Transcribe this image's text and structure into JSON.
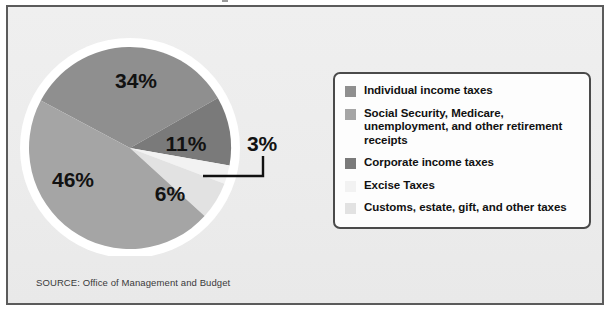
{
  "figure": {
    "source_note": "SOURCE: Office of Management and Budget",
    "background_color": "#ececec",
    "frame_color": "#5b5b5b"
  },
  "callout": {
    "label": "3%"
  },
  "legend": {
    "box_border_color": "#4a4a4a",
    "box_background": "#fdfdfd",
    "items": [
      {
        "label": "Individual income taxes",
        "color": "#8f8f8f"
      },
      {
        "label": "Social Security, Medicare, unemployment, and other retirement receipts",
        "color": "#a5a5a5"
      },
      {
        "label": "Corporate income taxes",
        "color": "#7a7a7a"
      },
      {
        "label": "Excise Taxes",
        "color": "#f2f2f2"
      },
      {
        "label": "Customs, estate, gift, and other taxes",
        "color": "#e2e2e2"
      }
    ]
  },
  "chart_data": {
    "type": "pie",
    "title": "",
    "subtitle": "",
    "xlabel": "",
    "ylabel": "",
    "legend_position": "right",
    "grid": false,
    "units": "percent",
    "categories": [
      "Individual income taxes",
      "Social Security, Medicare, unemployment, and other retirement receipts",
      "Corporate income taxes",
      "Excise Taxes",
      "Customs, estate, gift, and other taxes"
    ],
    "values": [
      34,
      46,
      11,
      3,
      6
    ],
    "data_labels": [
      "34%",
      "46%",
      "11%",
      "3%",
      "6%"
    ],
    "colors": [
      "#8f8f8f",
      "#a5a5a5",
      "#7a7a7a",
      "#f2f2f2",
      "#e2e2e2"
    ],
    "slices": [
      {
        "name": "Individual income taxes",
        "value": 34,
        "label": "34%",
        "color": "#8f8f8f",
        "start_angle": -62,
        "end_angle": 60.4,
        "label_x": 118,
        "label_y": 64,
        "label_inside": true
      },
      {
        "name": "Corporate income taxes",
        "value": 11,
        "label": "11%",
        "color": "#7a7a7a",
        "start_angle": 60.4,
        "end_angle": 100,
        "label_x": 168,
        "label_y": 127,
        "label_inside": true
      },
      {
        "name": "Excise Taxes",
        "value": 3,
        "label": "3%",
        "color": "#f2f2f2",
        "start_angle": 100,
        "end_angle": 110.8,
        "label_x": 0,
        "label_y": 0,
        "label_inside": false
      },
      {
        "name": "Customs, estate, gift, and other taxes",
        "value": 6,
        "label": "6%",
        "color": "#e2e2e2",
        "start_angle": 110.8,
        "end_angle": 132.4,
        "label_x": 152,
        "label_y": 177,
        "label_inside": true
      },
      {
        "name": "Social Security, Medicare, unemployment, and other retirement receipts",
        "value": 46,
        "label": "46%",
        "color": "#a5a5a5",
        "start_angle": 132.4,
        "end_angle": 298,
        "label_x": 55,
        "label_y": 163,
        "label_inside": true
      }
    ]
  }
}
